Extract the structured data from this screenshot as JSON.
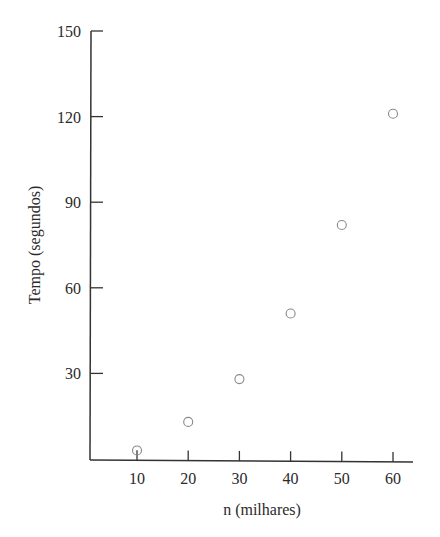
{
  "chart_data": {
    "type": "scatter",
    "title": "",
    "xlabel": "n (milhares)",
    "ylabel": "Tempo (segundos)",
    "x": [
      10,
      20,
      30,
      40,
      50,
      60
    ],
    "series": [
      {
        "name": "Tempo",
        "values": [
          3,
          13,
          28,
          51,
          82,
          121
        ],
        "marker": "open-circle",
        "color": "#888888"
      }
    ],
    "xticks": [
      10,
      20,
      30,
      40,
      50,
      60
    ],
    "yticks": [
      30,
      60,
      90,
      120,
      150
    ],
    "xlim": [
      0,
      64
    ],
    "ylim": [
      0,
      150
    ],
    "grid": false,
    "legend": null
  }
}
